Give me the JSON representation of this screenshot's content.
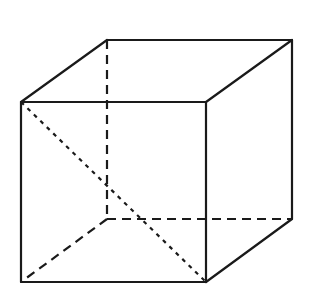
{
  "diagram": {
    "type": "cube-wireframe",
    "stroke_color": "#1a1a1a",
    "background": "#ffffff",
    "vertices": {
      "front_top_left": [
        21,
        102
      ],
      "front_top_right": [
        206,
        102
      ],
      "front_bottom_right": [
        206,
        282
      ],
      "front_bottom_left": [
        21,
        282
      ],
      "back_top_left": [
        107,
        40
      ],
      "back_top_right": [
        292,
        40
      ],
      "back_bottom_right": [
        292,
        219
      ],
      "back_bottom_left": [
        107,
        219
      ]
    },
    "solid_edges": [
      [
        "front_top_left",
        "front_top_right"
      ],
      [
        "front_top_right",
        "front_bottom_right"
      ],
      [
        "front_bottom_right",
        "front_bottom_left"
      ],
      [
        "front_bottom_left",
        "front_top_left"
      ],
      [
        "front_top_left",
        "back_top_left"
      ],
      [
        "back_top_left",
        "back_top_right"
      ],
      [
        "front_top_right",
        "back_top_right"
      ],
      [
        "back_top_right",
        "back_bottom_right"
      ],
      [
        "front_bottom_right",
        "back_bottom_right"
      ]
    ],
    "hidden_edges": [
      [
        "back_top_left",
        "back_bottom_left"
      ],
      [
        "back_bottom_left",
        "back_bottom_right"
      ],
      [
        "back_bottom_left",
        "front_bottom_left"
      ]
    ],
    "dotted_diagonals": [
      [
        "front_top_left",
        "front_bottom_right"
      ]
    ]
  }
}
